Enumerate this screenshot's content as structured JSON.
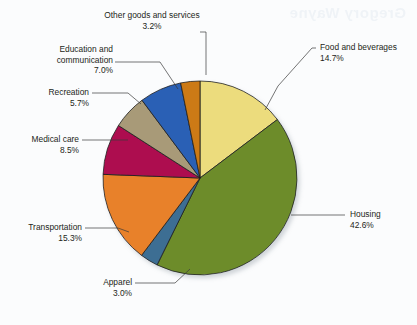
{
  "watermark": {
    "text": "Gregory Wayne"
  },
  "chart_data": {
    "type": "pie",
    "title": "",
    "subtitle": "",
    "xlabel": "",
    "ylabel": "",
    "legend_position": "callout-labels",
    "grid": false,
    "start_angle_deg": 0,
    "direction": "clockwise",
    "units": "percent",
    "categories": [
      "Food and beverages",
      "Housing",
      "Apparel",
      "Transportation",
      "Medical care",
      "Recreation",
      "Education and communication",
      "Other goods and services"
    ],
    "values": [
      14.7,
      42.6,
      3.0,
      15.3,
      8.5,
      5.7,
      7.0,
      3.2
    ],
    "value_labels": [
      "14.7%",
      "42.6%",
      "3.0%",
      "15.3%",
      "8.5%",
      "5.7%",
      "7.0%",
      "3.2%"
    ],
    "colors": [
      "#ecdc7d",
      "#6d8c2c",
      "#3d6e93",
      "#e8812b",
      "#ad0f50",
      "#a89a78",
      "#2b60b5",
      "#cc7a14"
    ],
    "slices": [
      {
        "label": "Food and beverages",
        "value": 14.7,
        "value_label": "14.7%",
        "color": "#ecdc7d"
      },
      {
        "label": "Housing",
        "value": 42.6,
        "value_label": "42.6%",
        "color": "#6d8c2c"
      },
      {
        "label": "Apparel",
        "value": 3.0,
        "value_label": "3.0%",
        "color": "#3d6e93"
      },
      {
        "label": "Transportation",
        "value": 15.3,
        "value_label": "15.3%",
        "color": "#e8812b"
      },
      {
        "label": "Medical care",
        "value": 8.5,
        "value_label": "8.5%",
        "color": "#ad0f50"
      },
      {
        "label": "Recreation",
        "value": 5.7,
        "value_label": "5.7%",
        "color": "#a89a78"
      },
      {
        "label": "Education and communication",
        "value": 7.0,
        "value_label": "7.0%",
        "color": "#2b60b5"
      },
      {
        "label": "Other goods and services",
        "value": 3.2,
        "value_label": "3.2%",
        "color": "#cc7a14"
      }
    ]
  },
  "labels": {
    "other_goods_line1": "Other goods and services",
    "other_goods_pct": "3.2%",
    "education_line1": "Education and",
    "education_line2": "communication",
    "education_pct": "7.0%",
    "recreation_line1": "Recreation",
    "recreation_pct": "5.7%",
    "medical_line1": "Medical care",
    "medical_pct": "8.5%",
    "transportation_line1": "Transportation",
    "transportation_pct": "15.3%",
    "apparel_line1": "Apparel",
    "apparel_pct": "3.0%",
    "food_line1": "Food and beverages",
    "food_pct": "14.7%",
    "housing_line1": "Housing",
    "housing_pct": "42.6%"
  }
}
